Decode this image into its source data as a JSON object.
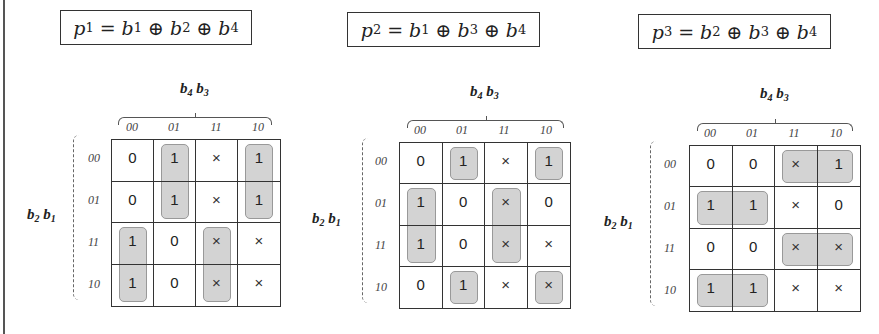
{
  "figure": {
    "col_variable": {
      "a": "b",
      "a_sub": "4",
      "b": "b",
      "b_sub": "3"
    },
    "row_variable": {
      "a": "b",
      "a_sub": "2",
      "b": "b",
      "b_sub": "1"
    },
    "col_labels": [
      "00",
      "01",
      "11",
      "10"
    ],
    "row_labels": [
      "00",
      "01",
      "11",
      "10"
    ],
    "highlight_color": "#d3d3d3",
    "maps": [
      {
        "title": {
          "lhs": "p",
          "lhs_sub": "1",
          "eq": "=",
          "terms": [
            {
              "v": "b",
              "s": "1"
            },
            {
              "v": "b",
              "s": "2"
            },
            {
              "v": "b",
              "s": "4"
            }
          ],
          "op": "⊕"
        },
        "cells": [
          [
            "0",
            "1",
            "×",
            "1"
          ],
          [
            "0",
            "1",
            "×",
            "1"
          ],
          [
            "1",
            "0",
            "×",
            "×"
          ],
          [
            "1",
            "0",
            "×",
            "×"
          ]
        ],
        "groups": [
          {
            "row": 0,
            "col": 1,
            "rows": 2,
            "cols": 1
          },
          {
            "row": 0,
            "col": 3,
            "rows": 2,
            "cols": 1
          },
          {
            "row": 2,
            "col": 0,
            "rows": 2,
            "cols": 1
          },
          {
            "row": 2,
            "col": 2,
            "rows": 2,
            "cols": 1
          }
        ]
      },
      {
        "title": {
          "lhs": "p",
          "lhs_sub": "2",
          "eq": "=",
          "terms": [
            {
              "v": "b",
              "s": "1"
            },
            {
              "v": "b",
              "s": "3"
            },
            {
              "v": "b",
              "s": "4"
            }
          ],
          "op": "⊕"
        },
        "cells": [
          [
            "0",
            "1",
            "×",
            "1"
          ],
          [
            "1",
            "0",
            "×",
            "0"
          ],
          [
            "1",
            "0",
            "×",
            "×"
          ],
          [
            "0",
            "1",
            "×",
            "×"
          ]
        ],
        "groups": [
          {
            "row": 0,
            "col": 1,
            "rows": 1,
            "cols": 1
          },
          {
            "row": 0,
            "col": 3,
            "rows": 1,
            "cols": 1
          },
          {
            "row": 1,
            "col": 0,
            "rows": 2,
            "cols": 1
          },
          {
            "row": 1,
            "col": 2,
            "rows": 2,
            "cols": 1
          },
          {
            "row": 3,
            "col": 1,
            "rows": 1,
            "cols": 1
          },
          {
            "row": 3,
            "col": 3,
            "rows": 1,
            "cols": 1
          }
        ]
      },
      {
        "title": {
          "lhs": "p",
          "lhs_sub": "3",
          "eq": "=",
          "terms": [
            {
              "v": "b",
              "s": "2"
            },
            {
              "v": "b",
              "s": "3"
            },
            {
              "v": "b",
              "s": "4"
            }
          ],
          "op": "⊕"
        },
        "cells": [
          [
            "0",
            "0",
            "×",
            "1"
          ],
          [
            "1",
            "1",
            "×",
            "0"
          ],
          [
            "0",
            "0",
            "×",
            "×"
          ],
          [
            "1",
            "1",
            "×",
            "×"
          ]
        ],
        "groups": [
          {
            "row": 0,
            "col": 2,
            "rows": 1,
            "cols": 2
          },
          {
            "row": 1,
            "col": 0,
            "rows": 1,
            "cols": 2
          },
          {
            "row": 2,
            "col": 2,
            "rows": 1,
            "cols": 2
          },
          {
            "row": 3,
            "col": 0,
            "rows": 1,
            "cols": 2
          }
        ]
      }
    ]
  }
}
